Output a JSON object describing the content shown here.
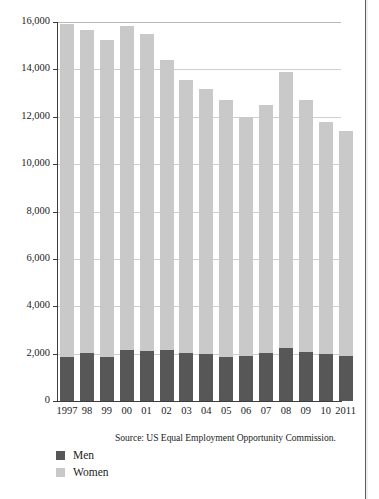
{
  "figure": {
    "source_note": "Source: US Equal Employment Opportunity Commission.",
    "background_color": "#ffffff"
  },
  "legend": {
    "position": "bottom-left",
    "items": [
      {
        "label": "Men",
        "color": "#575757",
        "swatch_name": "legend-swatch-men"
      },
      {
        "label": "Women",
        "color": "#c9c9c9",
        "swatch_name": "legend-swatch-women"
      }
    ]
  },
  "chart_data": {
    "type": "bar",
    "subtype": "stacked-vertical",
    "title": "",
    "subtitle": "",
    "xlabel": "",
    "ylabel": "",
    "categories": [
      "1997",
      "98",
      "99",
      "00",
      "01",
      "02",
      "03",
      "04",
      "05",
      "06",
      "07",
      "08",
      "09",
      "10",
      "2011"
    ],
    "x_full_years": [
      1997,
      1998,
      1999,
      2000,
      2001,
      2002,
      2003,
      2004,
      2005,
      2006,
      2007,
      2008,
      2009,
      2010,
      2011
    ],
    "series": [
      {
        "name": "Men",
        "color": "#575757",
        "values": [
          1850,
          2020,
          1860,
          2150,
          2110,
          2150,
          2010,
          1980,
          1860,
          1890,
          2020,
          2250,
          2060,
          1980,
          1900
        ]
      },
      {
        "name": "Women",
        "color": "#c9c9c9",
        "values": [
          14050,
          13630,
          13390,
          13700,
          13390,
          12240,
          11560,
          11180,
          10840,
          10110,
          10490,
          11620,
          10640,
          9780,
          9480
        ]
      }
    ],
    "totals": [
      15900,
      15650,
      15250,
      15850,
      15500,
      14390,
      13570,
      13160,
      12700,
      12000,
      12510,
      13870,
      12700,
      11760,
      11380
    ],
    "ylim": [
      0,
      16000
    ],
    "yticks": [
      0,
      2000,
      4000,
      6000,
      8000,
      10000,
      12000,
      14000,
      16000
    ],
    "ytick_labels": [
      "0",
      "2,000",
      "4,000",
      "6,000",
      "8,000",
      "10,000",
      "12,000",
      "14,000",
      "16,000"
    ],
    "grid": true,
    "grid_axis": "y",
    "legend_position": "bottom-left"
  }
}
